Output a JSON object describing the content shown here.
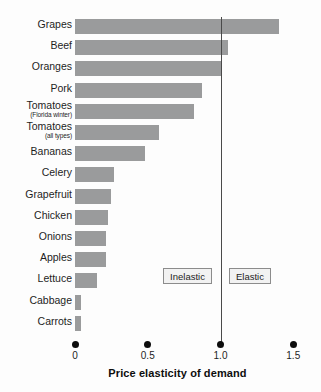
{
  "chart_data": {
    "type": "bar",
    "orientation": "horizontal",
    "title": "",
    "xlabel": "Price elasticity of demand",
    "ylabel": "",
    "xlim": [
      0,
      1.5
    ],
    "grid": false,
    "legend": false,
    "categories": [
      "Grapes",
      "Beef",
      "Oranges",
      "Pork",
      "Tomatoes",
      "Tomatoes",
      "Bananas",
      "Celery",
      "Grapefruit",
      "Chicken",
      "Onions",
      "Apples",
      "Lettuce",
      "Cabbage",
      "Carrots"
    ],
    "category_sublabels": [
      "",
      "",
      "",
      "",
      "(Florida winter)",
      "(all types)",
      "",
      "",
      "",
      "",
      "",
      "",
      "",
      "",
      ""
    ],
    "values": [
      1.4,
      1.05,
      1.0,
      0.87,
      0.82,
      0.58,
      0.48,
      0.27,
      0.25,
      0.23,
      0.21,
      0.21,
      0.15,
      0.04,
      0.04
    ],
    "tick_values": [
      0,
      0.5,
      1.0,
      1.5
    ],
    "tick_labels": [
      "0",
      "0.5",
      "1.0",
      "1.5"
    ],
    "reference_line": {
      "value": 1.0,
      "label": "unit elasticity"
    },
    "annotations": [
      {
        "label": "Inelastic",
        "region": "left-of-unit-line"
      },
      {
        "label": "Elastic",
        "region": "right-of-unit-line"
      }
    ],
    "colors": {
      "bar": "#9a9b9c",
      "reference_line": "#4a4a4a",
      "background": "#fdfdfd",
      "text": "#1d1d1d",
      "annotation_box_fill": "#f2f2f2",
      "annotation_box_border": "#8c8c8c"
    }
  }
}
